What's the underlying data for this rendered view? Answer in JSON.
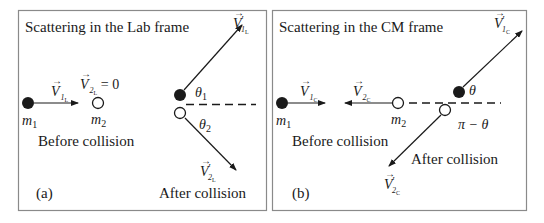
{
  "panels": [
    {
      "id": "a",
      "title": "Scattering in the Lab frame",
      "panel_label": "(a)",
      "before_caption": "Before collision",
      "after_caption": "After collision",
      "mass1": {
        "symbol": "m",
        "index": "1"
      },
      "mass2": {
        "symbol": "m",
        "index": "2"
      },
      "v1_before": {
        "symbol": "V",
        "index": "1",
        "frame": "L",
        "prime": ""
      },
      "v2_before": {
        "symbol": "V",
        "index": "2",
        "frame": "L",
        "prime": "",
        "equals": "= 0"
      },
      "v1_after": {
        "symbol": "V",
        "index": "1",
        "frame": "L",
        "prime": "′"
      },
      "v2_after": {
        "symbol": "V",
        "index": "2",
        "frame": "L",
        "prime": "′"
      },
      "angle1": {
        "symbol": "θ",
        "index": "1"
      },
      "angle2": {
        "symbol": "θ",
        "index": "2"
      }
    },
    {
      "id": "b",
      "title": "Scattering in the CM frame",
      "panel_label": "(b)",
      "before_caption": "Before collision",
      "after_caption": "After collision",
      "mass1": {
        "symbol": "m",
        "index": "1"
      },
      "mass2": {
        "symbol": "m",
        "index": "2"
      },
      "v1_before": {
        "symbol": "V",
        "index": "1",
        "frame": "C",
        "prime": ""
      },
      "v2_before": {
        "symbol": "V",
        "index": "2",
        "frame": "C",
        "prime": ""
      },
      "v1_after": {
        "symbol": "V",
        "index": "1",
        "frame": "C",
        "prime": "′"
      },
      "v2_after": {
        "symbol": "V",
        "index": "2",
        "frame": "C",
        "prime": "′"
      },
      "angle1": {
        "symbol": "θ"
      },
      "angle2": {
        "symbol": "π − θ"
      }
    }
  ],
  "colors": {
    "ink": "#1a1a1a",
    "border": "#8a8a8a",
    "background": "#ffffff"
  }
}
